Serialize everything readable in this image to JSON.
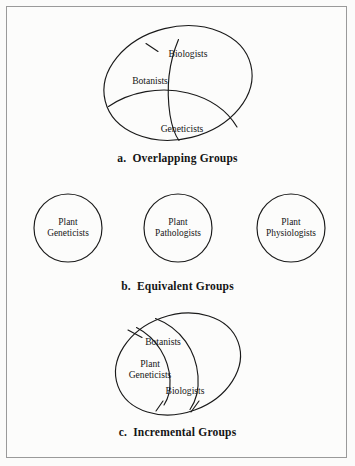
{
  "figure": {
    "background_color": "#fcfcfb",
    "border_color": "#9a9a9a",
    "stroke_color": "#1a1a1a"
  },
  "panels": [
    {
      "id": "a",
      "caption": "a.  Overlapping Groups",
      "type": "overlapping-ellipse",
      "labels": [
        {
          "name": "biologists",
          "text": "Biologists",
          "x": 188,
          "y": 40
        },
        {
          "name": "botanists",
          "text": "Botanists",
          "x": 150,
          "y": 67
        },
        {
          "name": "geneticists",
          "text": "Geneticists",
          "x": 182,
          "y": 115
        }
      ]
    },
    {
      "id": "b",
      "caption": "b.  Equivalent Groups",
      "type": "equivalent-circles",
      "circles": [
        {
          "name": "plant-geneticists",
          "text": "Plant\nGeneticists",
          "cx": 68,
          "cy": 52,
          "r": 34
        },
        {
          "name": "plant-pathologists",
          "text": "Plant\nPathologists",
          "cx": 178,
          "cy": 52,
          "r": 34
        },
        {
          "name": "plant-physiologists",
          "text": "Plant\nPhysiologists",
          "cx": 291,
          "cy": 52,
          "r": 34
        }
      ]
    },
    {
      "id": "c",
      "caption": "c.  Incremental Groups",
      "type": "incremental-nested",
      "labels": [
        {
          "name": "botanists",
          "text": "Botanists",
          "x": 163,
          "y": 36
        },
        {
          "name": "plant-geneticists",
          "text": "Plant\nGeneticists",
          "x": 150,
          "y": 63
        },
        {
          "name": "biologists",
          "text": "Biologists",
          "x": 185,
          "y": 85
        }
      ]
    }
  ]
}
